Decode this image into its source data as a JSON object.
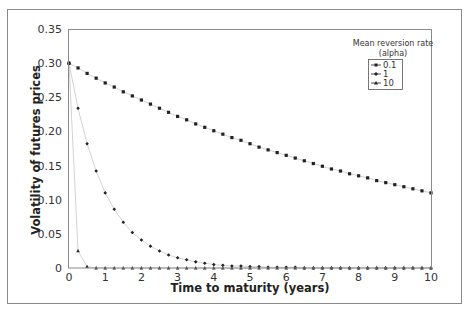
{
  "chart_data": {
    "type": "line",
    "title": "",
    "xlabel": "Time to maturity (years)",
    "ylabel": "Volatility of futures prices",
    "xlim": [
      0,
      10
    ],
    "ylim": [
      0,
      0.35
    ],
    "x_ticks": [
      "0",
      "1",
      "2",
      "3",
      "4",
      "5",
      "6",
      "7",
      "8",
      "9",
      "10"
    ],
    "y_ticks": [
      "0",
      "0.05",
      "0.10",
      "0.15",
      "0.20",
      "0.25",
      "0.30",
      "0.35"
    ],
    "grid": false,
    "legend": {
      "title_line1": "Mean reversion rate",
      "title_line2": "(alpha)",
      "position": "upper right",
      "entries": [
        "0.1",
        "1",
        "10"
      ]
    },
    "x": [
      0,
      0.25,
      0.5,
      0.75,
      1,
      1.25,
      1.5,
      1.75,
      2,
      2.25,
      2.5,
      2.75,
      3,
      3.25,
      3.5,
      3.75,
      4,
      4.25,
      4.5,
      4.75,
      5,
      5.25,
      5.5,
      5.75,
      6,
      6.25,
      6.5,
      6.75,
      7,
      7.25,
      7.5,
      7.75,
      8,
      8.25,
      8.5,
      8.75,
      9,
      9.25,
      9.5,
      9.75,
      10
    ],
    "series": [
      {
        "name": "0.1",
        "marker": "square",
        "values": [
          0.3,
          0.293,
          0.285,
          0.278,
          0.271,
          0.265,
          0.258,
          0.252,
          0.246,
          0.24,
          0.234,
          0.228,
          0.222,
          0.217,
          0.211,
          0.206,
          0.201,
          0.196,
          0.191,
          0.187,
          0.182,
          0.177,
          0.173,
          0.169,
          0.165,
          0.161,
          0.157,
          0.153,
          0.149,
          0.145,
          0.142,
          0.138,
          0.135,
          0.132,
          0.128,
          0.125,
          0.122,
          0.119,
          0.116,
          0.113,
          0.11
        ]
      },
      {
        "name": "1",
        "marker": "diamond",
        "values": [
          0.3,
          0.234,
          0.182,
          0.142,
          0.11,
          0.086,
          0.067,
          0.052,
          0.041,
          0.032,
          0.025,
          0.019,
          0.015,
          0.012,
          0.009,
          0.007,
          0.005,
          0.004,
          0.003,
          0.003,
          0.002,
          0.002,
          0.001,
          0.001,
          0.001,
          0.001,
          0.0,
          0.0,
          0.0,
          0.0,
          0.0,
          0.0,
          0.0,
          0.0,
          0.0,
          0.0,
          0.0,
          0.0,
          0.0,
          0.0,
          0.0
        ]
      },
      {
        "name": "10",
        "marker": "triangle",
        "values": [
          0.3,
          0.025,
          0.002,
          0.0,
          0.0,
          0.0,
          0.0,
          0.0,
          0.0,
          0.0,
          0.0,
          0.0,
          0.0,
          0.0,
          0.0,
          0.0,
          0.0,
          0.0,
          0.0,
          0.0,
          0.0,
          0.0,
          0.0,
          0.0,
          0.0,
          0.0,
          0.0,
          0.0,
          0.0,
          0.0,
          0.0,
          0.0,
          0.0,
          0.0,
          0.0,
          0.0,
          0.0,
          0.0,
          0.0,
          0.0,
          0.0
        ]
      }
    ]
  },
  "colors": {
    "frame": "#8a8a8a",
    "axis": "#8a8a8a",
    "line": "#c8c8c8",
    "marker": "#222222"
  }
}
